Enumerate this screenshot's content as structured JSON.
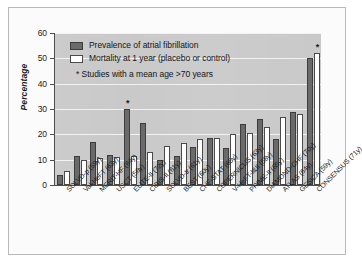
{
  "chart_data": {
    "type": "bar",
    "title": "",
    "subtitle": "",
    "xlabel": "",
    "ylabel": "Percentage",
    "ylim": [
      0,
      60
    ],
    "yticks": [
      0,
      10,
      20,
      30,
      40,
      50,
      60
    ],
    "grid": true,
    "legend_position": "top-left",
    "orientation": "vertical",
    "grouping": "grouped",
    "categories": [
      "SOLVD-p (59y)",
      "Val-HeFT (63y)",
      "MERIT-HF (64y)",
      "USCT (56y)",
      "ELITE-II (72y)",
      "CIBIS-II (61y)",
      "SOLVD-tr (61y)",
      "BEST (60y)",
      "CHF-STAT (65y)",
      "COPERNICUS (63y)",
      "V-HeFT-I&II (58y)",
      "PRIME-II (65y)",
      "DIAMOND-CHF (70y)",
      "ATLAS (64y)",
      "GESICA (59y)",
      "CONSENSUS (71y)"
    ],
    "series": [
      {
        "name": "Prevalence of atrial fibrillation",
        "color": "#6a6a6a",
        "values": [
          4,
          11.5,
          17,
          12,
          30,
          24.5,
          10,
          11.5,
          15,
          18.5,
          14.5,
          24,
          26,
          18,
          29,
          50
        ]
      },
      {
        "name": "Mortality at 1 year (placebo or control)",
        "color": "#ffffff",
        "values": [
          5.5,
          10,
          10.5,
          11,
          11.5,
          13,
          15.5,
          16.5,
          18,
          18.5,
          20,
          20.5,
          23,
          27,
          28,
          52
        ]
      }
    ],
    "annotations": [
      {
        "category": "ELITE-II (72y)",
        "marker": "*"
      },
      {
        "category": "CONSENSUS (71y)",
        "marker": "*"
      }
    ],
    "footnote": "* Studies with a mean age >70 years"
  },
  "legend": {
    "items": [
      {
        "label": "Prevalence of atrial fibrillation",
        "swatch": "dark"
      },
      {
        "label": "Mortality at 1 year (placebo or control)",
        "swatch": "light"
      }
    ],
    "note": "* Studies with a mean age >70 years"
  },
  "axes": {
    "y_title": "Percentage",
    "y_tick_labels": [
      "60",
      "50",
      "40",
      "30",
      "20",
      "10",
      "0"
    ]
  }
}
